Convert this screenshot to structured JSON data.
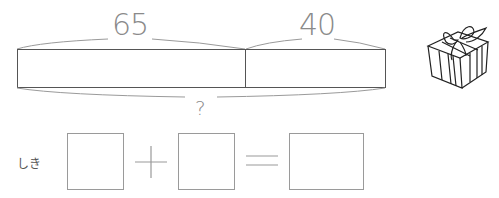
{
  "tape_diagram": {
    "left_segment_label": "65",
    "right_segment_label": "40",
    "total_label": "?"
  },
  "illustration": {
    "icon": "gift-box-icon"
  },
  "equation": {
    "label": "しき",
    "operator_plus": "+",
    "operator_equals": "=",
    "boxes": [
      "",
      "",
      ""
    ]
  }
}
